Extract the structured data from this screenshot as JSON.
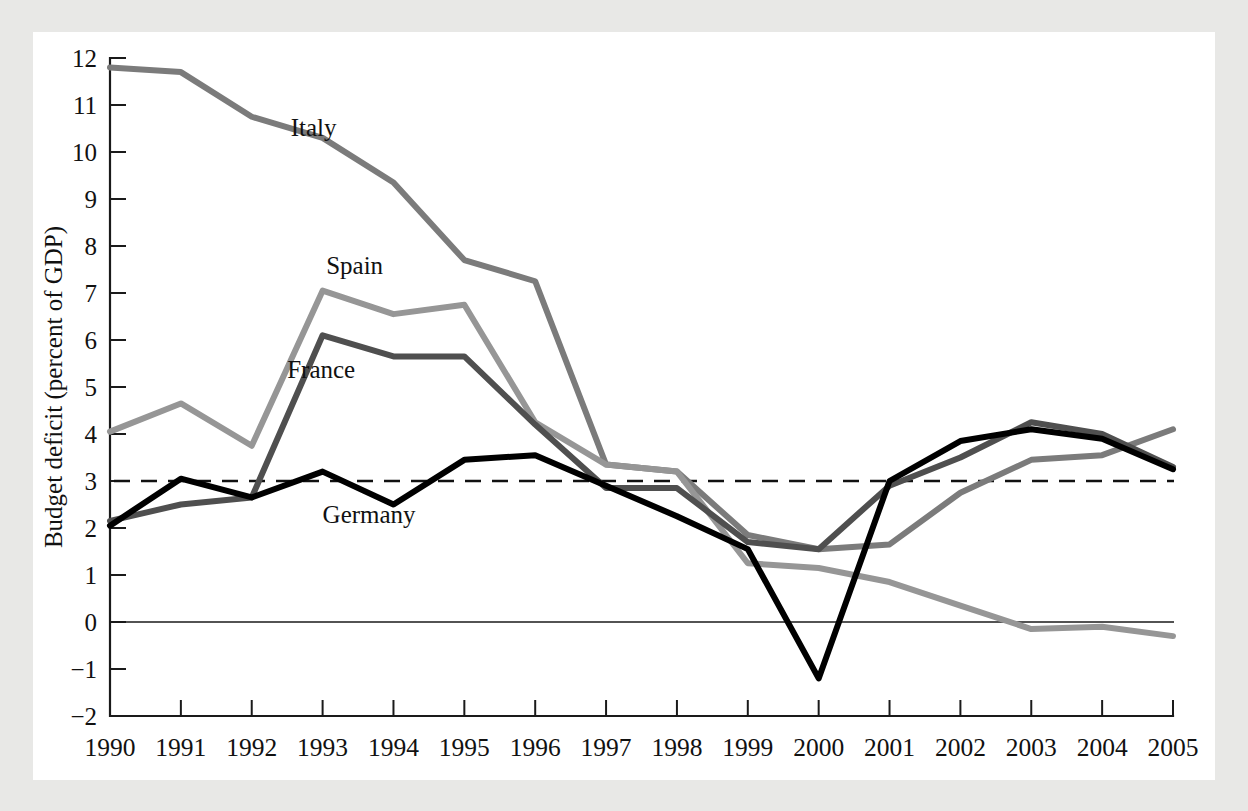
{
  "figure": {
    "background_color": "#e8e8e6",
    "card_color": "#ffffff"
  },
  "chart_data": {
    "type": "line",
    "title": "",
    "xlabel": "",
    "ylabel": "Budget deficit (percent of GDP)",
    "x": [
      1990,
      1991,
      1992,
      1993,
      1994,
      1995,
      1996,
      1997,
      1998,
      1999,
      2000,
      2001,
      2002,
      2003,
      2004,
      2005
    ],
    "xtick_labels": [
      "1990",
      "1991",
      "1992",
      "1993",
      "1994",
      "1995",
      "1996",
      "1997",
      "1998",
      "1999",
      "2000",
      "2001",
      "2002",
      "2003",
      "2004",
      "2005"
    ],
    "ytick_labels": [
      "12",
      "11",
      "10",
      "9",
      "8",
      "7",
      "6",
      "5",
      "4",
      "3",
      "2",
      "1",
      "0",
      "-1",
      "-2"
    ],
    "ytick_values": [
      12,
      11,
      10,
      9,
      8,
      7,
      6,
      5,
      4,
      3,
      2,
      1,
      0,
      -1,
      -2
    ],
    "xlim": [
      1990,
      2005
    ],
    "ylim": [
      -2,
      12
    ],
    "grid": false,
    "legend_position": "inline-labels",
    "reference_line": {
      "label": "3 percent Maastricht limit",
      "value": 3.0,
      "style": "dashed",
      "color": "#111111"
    },
    "zero_line": {
      "value": 0.0,
      "style": "solid",
      "color": "#1a1a1a"
    },
    "series": [
      {
        "name": "Italy",
        "color": "#7b7b7b",
        "width": 6.0,
        "label_x": 1992.55,
        "label_y": 10.35,
        "values": [
          11.8,
          11.7,
          10.75,
          10.3,
          9.35,
          7.7,
          7.25,
          3.35,
          3.2,
          1.85,
          1.55,
          1.65,
          2.75,
          3.45,
          3.55,
          4.1
        ]
      },
      {
        "name": "Spain",
        "color": "#969696",
        "width": 6.0,
        "label_x": 1993.05,
        "label_y": 7.4,
        "values": [
          4.05,
          4.65,
          3.75,
          7.05,
          6.55,
          6.75,
          4.25,
          3.35,
          3.2,
          1.25,
          1.15,
          0.85,
          0.35,
          -0.15,
          -0.1,
          -0.3
        ]
      },
      {
        "name": "France",
        "color": "#4f4f4f",
        "width": 6.0,
        "label_x": 1992.5,
        "label_y": 5.2,
        "values": [
          2.15,
          2.5,
          2.65,
          6.1,
          5.65,
          5.65,
          4.2,
          2.85,
          2.85,
          1.7,
          1.55,
          2.9,
          3.5,
          4.25,
          4.0,
          3.3
        ]
      },
      {
        "name": "Germany",
        "color": "#000000",
        "width": 6.0,
        "label_x": 1993.0,
        "label_y": 2.1,
        "values": [
          2.05,
          3.05,
          2.65,
          3.2,
          2.5,
          3.45,
          3.55,
          2.9,
          2.25,
          1.55,
          -1.2,
          3.0,
          3.85,
          4.1,
          3.9,
          3.25
        ]
      }
    ]
  }
}
